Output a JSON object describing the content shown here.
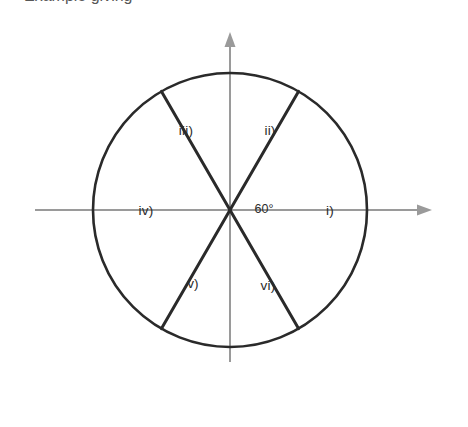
{
  "figure": {
    "clipped_caption_fragment": "Example giving",
    "angle_label": "60°",
    "circle": {
      "center_x": 230,
      "center_y": 210,
      "radius": 137,
      "stroke_color": "#2a2a2a",
      "stroke_width": 2.6
    },
    "axes": {
      "color": "#9a9a9a",
      "stroke_width": 2,
      "vertical": {
        "x": 230,
        "top_y": 32,
        "bottom_y": 362,
        "arrow": "up"
      },
      "horizontal": {
        "y": 210,
        "left_x": 35,
        "right_x": 432,
        "arrow": "right"
      }
    },
    "divider_lines": {
      "color": "#2a2a2a",
      "stroke_width": 3,
      "angles_deg": [
        60,
        120
      ]
    },
    "sectors": [
      {
        "id": "i",
        "label": "i)",
        "x": 330,
        "y": 211,
        "angle_range_deg": [
          -30,
          30
        ]
      },
      {
        "id": "ii",
        "label": "ii)",
        "x": 270,
        "y": 131,
        "angle_range_deg": [
          30,
          90
        ]
      },
      {
        "id": "iii",
        "label": "iii)",
        "x": 186,
        "y": 131,
        "angle_range_deg": [
          90,
          150
        ]
      },
      {
        "id": "iv",
        "label": "iv)",
        "x": 146,
        "y": 211,
        "angle_range_deg": [
          150,
          210
        ]
      },
      {
        "id": "v",
        "label": "v)",
        "x": 193,
        "y": 284,
        "angle_range_deg": [
          210,
          270
        ]
      },
      {
        "id": "vi",
        "label": "vi)",
        "x": 268,
        "y": 286,
        "angle_range_deg": [
          270,
          330
        ]
      }
    ],
    "angle_marker": {
      "x": 264,
      "y": 209
    },
    "background_color": "#ffffff"
  }
}
